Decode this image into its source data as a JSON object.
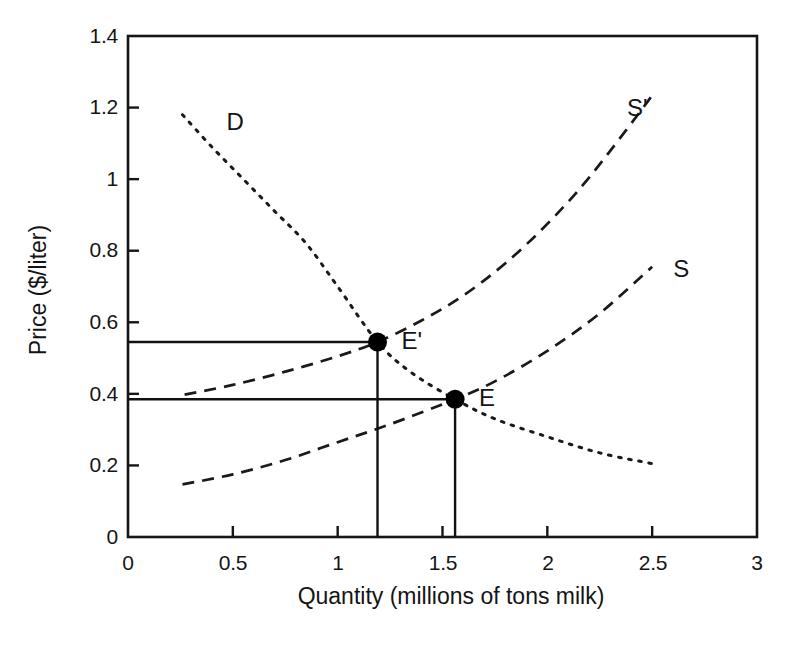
{
  "chart_data": {
    "type": "line",
    "title": "",
    "subtitle": "",
    "xlabel": "Quantity (millions of tons milk)",
    "ylabel": "Price ($/liter)",
    "xlim": [
      0,
      3
    ],
    "ylim": [
      0,
      1.4
    ],
    "grid": false,
    "legend_position": "inline-curve-labels",
    "xticks": [
      "0",
      "0.5",
      "1",
      "1.5",
      "2",
      "2.5",
      "3"
    ],
    "xtick_values": [
      0,
      0.5,
      1,
      1.5,
      2,
      2.5,
      3
    ],
    "yticks": [
      "0",
      "0.2",
      "0.4",
      "0.6",
      "0.8",
      "1",
      "1.2",
      "1.4"
    ],
    "ytick_values": [
      0,
      0.2,
      0.4,
      0.6,
      0.8,
      1.0,
      1.2,
      1.4
    ],
    "series": [
      {
        "name": "D",
        "label": "D",
        "style": "dotted",
        "label_x": 0.47,
        "label_y": 1.16,
        "points": [
          [
            0.26,
            1.18
          ],
          [
            0.4,
            1.09
          ],
          [
            0.55,
            1.0
          ],
          [
            0.7,
            0.91
          ],
          [
            0.85,
            0.82
          ],
          [
            1.0,
            0.7
          ],
          [
            1.19,
            0.545
          ],
          [
            1.35,
            0.46
          ],
          [
            1.56,
            0.385
          ],
          [
            1.75,
            0.33
          ],
          [
            2.0,
            0.28
          ],
          [
            2.25,
            0.235
          ],
          [
            2.5,
            0.205
          ]
        ]
      },
      {
        "name": "S",
        "label": "S",
        "style": "dashed",
        "label_x": 2.6,
        "label_y": 0.75,
        "points": [
          [
            0.26,
            0.147
          ],
          [
            0.5,
            0.175
          ],
          [
            0.75,
            0.215
          ],
          [
            1.0,
            0.265
          ],
          [
            1.25,
            0.315
          ],
          [
            1.56,
            0.385
          ],
          [
            1.75,
            0.435
          ],
          [
            2.0,
            0.52
          ],
          [
            2.25,
            0.625
          ],
          [
            2.5,
            0.755
          ]
        ]
      },
      {
        "name": "S'",
        "label": "S'",
        "style": "dashed",
        "label_x": 2.38,
        "label_y": 1.2,
        "points": [
          [
            0.27,
            0.398
          ],
          [
            0.5,
            0.425
          ],
          [
            0.75,
            0.462
          ],
          [
            1.0,
            0.505
          ],
          [
            1.19,
            0.545
          ],
          [
            1.4,
            0.605
          ],
          [
            1.6,
            0.675
          ],
          [
            1.8,
            0.765
          ],
          [
            2.0,
            0.875
          ],
          [
            2.2,
            1.005
          ],
          [
            2.47,
            1.21
          ],
          [
            2.5,
            1.24
          ]
        ]
      }
    ],
    "equilibria": [
      {
        "name": "E'",
        "label": "E'",
        "x": 1.19,
        "y": 0.545,
        "label_offset_x": 24,
        "label_offset_y": -15
      },
      {
        "name": "E",
        "label": "E",
        "x": 1.56,
        "y": 0.385,
        "label_offset_x": 24,
        "label_offset_y": -15
      }
    ],
    "guide_lines": [
      {
        "name": "E'-price-line",
        "from": [
          0,
          0.545
        ],
        "to": [
          1.19,
          0.545
        ]
      },
      {
        "name": "E'-quantity-line",
        "from": [
          1.19,
          0
        ],
        "to": [
          1.19,
          0.545
        ]
      },
      {
        "name": "E-price-line",
        "from": [
          0,
          0.385
        ],
        "to": [
          1.56,
          0.385
        ]
      },
      {
        "name": "E-quantity-line",
        "from": [
          1.56,
          0
        ],
        "to": [
          1.56,
          0.385
        ]
      }
    ],
    "colors": {
      "axis": "#151515",
      "curve": "#1a1a1a",
      "guide": "#111111",
      "marker": "#000000",
      "background": "#ffffff"
    }
  }
}
